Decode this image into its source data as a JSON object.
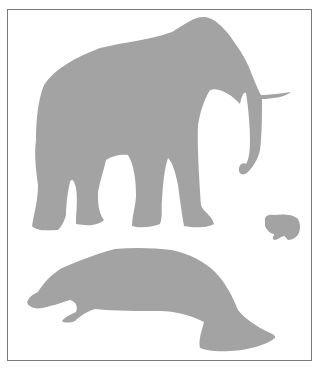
{
  "figure": {
    "frame_color": "#7a7a7a",
    "silhouette_color": "#a3a3a3",
    "background": "#ffffff",
    "animals": [
      {
        "name": "elephant",
        "label": "elephant"
      },
      {
        "name": "hyrax",
        "label": "hyrax"
      },
      {
        "name": "manatee",
        "label": "manatee"
      }
    ]
  }
}
